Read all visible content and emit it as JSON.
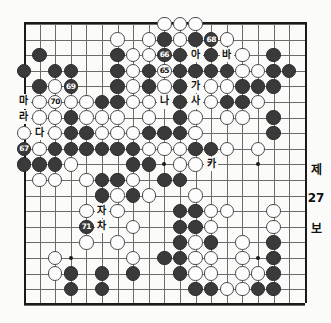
{
  "board": {
    "size": 19,
    "origin_x": 24,
    "origin_y": 22,
    "spacing": 15.6,
    "stone_radius": 7.2,
    "star_points": [
      [
        3,
        3
      ],
      [
        9,
        3
      ],
      [
        15,
        3
      ],
      [
        3,
        9
      ],
      [
        9,
        9
      ],
      [
        15,
        9
      ],
      [
        3,
        15
      ],
      [
        9,
        15
      ],
      [
        15,
        15
      ]
    ],
    "colors": {
      "black_stone": "#3a3a3a",
      "white_stone": "#fdfdfd",
      "grid": "#6b6b6b",
      "border": "#1a1a1a",
      "paper": "#fbfbf9"
    }
  },
  "stones": [
    {
      "c": "w",
      "x": 9,
      "y": 0
    },
    {
      "c": "w",
      "x": 10,
      "y": 0
    },
    {
      "c": "w",
      "x": 11,
      "y": 0
    },
    {
      "c": "w",
      "x": 6,
      "y": 1
    },
    {
      "c": "w",
      "x": 8,
      "y": 1
    },
    {
      "c": "b",
      "x": 9,
      "y": 1
    },
    {
      "c": "w",
      "x": 10,
      "y": 1
    },
    {
      "c": "b",
      "x": 11,
      "y": 1
    },
    {
      "c": "b",
      "x": 12,
      "y": 1,
      "n": "68"
    },
    {
      "c": "w",
      "x": 13,
      "y": 1
    },
    {
      "c": "b",
      "x": 1,
      "y": 2
    },
    {
      "c": "b",
      "x": 6,
      "y": 2
    },
    {
      "c": "w",
      "x": 7,
      "y": 2
    },
    {
      "c": "w",
      "x": 8,
      "y": 2
    },
    {
      "c": "b",
      "x": 9,
      "y": 2,
      "n": "66"
    },
    {
      "c": "b",
      "x": 10,
      "y": 2
    },
    {
      "c": "b",
      "x": 12,
      "y": 2
    },
    {
      "c": "w",
      "x": 14,
      "y": 2
    },
    {
      "c": "b",
      "x": 16,
      "y": 2
    },
    {
      "c": "b",
      "x": 0,
      "y": 3
    },
    {
      "c": "b",
      "x": 2,
      "y": 3
    },
    {
      "c": "b",
      "x": 3,
      "y": 3
    },
    {
      "c": "b",
      "x": 6,
      "y": 3
    },
    {
      "c": "w",
      "x": 7,
      "y": 3
    },
    {
      "c": "b",
      "x": 8,
      "y": 3
    },
    {
      "c": "w",
      "x": 9,
      "y": 3,
      "n": "65"
    },
    {
      "c": "b",
      "x": 10,
      "y": 3
    },
    {
      "c": "b",
      "x": 11,
      "y": 3
    },
    {
      "c": "b",
      "x": 12,
      "y": 3
    },
    {
      "c": "b",
      "x": 13,
      "y": 3
    },
    {
      "c": "w",
      "x": 14,
      "y": 3
    },
    {
      "c": "w",
      "x": 15,
      "y": 3
    },
    {
      "c": "b",
      "x": 16,
      "y": 3
    },
    {
      "c": "b",
      "x": 17,
      "y": 3
    },
    {
      "c": "b",
      "x": 1,
      "y": 4
    },
    {
      "c": "w",
      "x": 2,
      "y": 4
    },
    {
      "c": "b",
      "x": 3,
      "y": 4,
      "n": "69"
    },
    {
      "c": "b",
      "x": 6,
      "y": 4
    },
    {
      "c": "w",
      "x": 7,
      "y": 4
    },
    {
      "c": "b",
      "x": 8,
      "y": 4
    },
    {
      "c": "w",
      "x": 9,
      "y": 4
    },
    {
      "c": "b",
      "x": 10,
      "y": 4
    },
    {
      "c": "w",
      "x": 12,
      "y": 4
    },
    {
      "c": "w",
      "x": 13,
      "y": 4
    },
    {
      "c": "b",
      "x": 14,
      "y": 4
    },
    {
      "c": "b",
      "x": 15,
      "y": 4
    },
    {
      "c": "b",
      "x": 16,
      "y": 4
    },
    {
      "c": "w",
      "x": 1,
      "y": 5
    },
    {
      "c": "w",
      "x": 2,
      "y": 5,
      "n": "70"
    },
    {
      "c": "w",
      "x": 3,
      "y": 5
    },
    {
      "c": "w",
      "x": 4,
      "y": 5
    },
    {
      "c": "b",
      "x": 5,
      "y": 5
    },
    {
      "c": "b",
      "x": 6,
      "y": 5
    },
    {
      "c": "w",
      "x": 7,
      "y": 5
    },
    {
      "c": "w",
      "x": 8,
      "y": 5
    },
    {
      "c": "b",
      "x": 10,
      "y": 5
    },
    {
      "c": "w",
      "x": 12,
      "y": 5
    },
    {
      "c": "b",
      "x": 13,
      "y": 5
    },
    {
      "c": "b",
      "x": 14,
      "y": 5
    },
    {
      "c": "w",
      "x": 15,
      "y": 5
    },
    {
      "c": "w",
      "x": 1,
      "y": 6
    },
    {
      "c": "w",
      "x": 2,
      "y": 6
    },
    {
      "c": "b",
      "x": 3,
      "y": 6
    },
    {
      "c": "w",
      "x": 4,
      "y": 6
    },
    {
      "c": "w",
      "x": 5,
      "y": 6
    },
    {
      "c": "w",
      "x": 6,
      "y": 6
    },
    {
      "c": "w",
      "x": 8,
      "y": 6
    },
    {
      "c": "b",
      "x": 10,
      "y": 6
    },
    {
      "c": "w",
      "x": 11,
      "y": 6
    },
    {
      "c": "w",
      "x": 13,
      "y": 6
    },
    {
      "c": "w",
      "x": 14,
      "y": 6
    },
    {
      "c": "b",
      "x": 16,
      "y": 6
    },
    {
      "c": "w",
      "x": 0,
      "y": 7
    },
    {
      "c": "w",
      "x": 2,
      "y": 7
    },
    {
      "c": "b",
      "x": 3,
      "y": 7
    },
    {
      "c": "b",
      "x": 4,
      "y": 7
    },
    {
      "c": "w",
      "x": 5,
      "y": 7
    },
    {
      "c": "w",
      "x": 6,
      "y": 7
    },
    {
      "c": "w",
      "x": 7,
      "y": 7
    },
    {
      "c": "b",
      "x": 8,
      "y": 7
    },
    {
      "c": "b",
      "x": 9,
      "y": 7
    },
    {
      "c": "b",
      "x": 10,
      "y": 7
    },
    {
      "c": "w",
      "x": 11,
      "y": 7
    },
    {
      "c": "b",
      "x": 16,
      "y": 7
    },
    {
      "c": "b",
      "x": 0,
      "y": 8,
      "n": "67"
    },
    {
      "c": "w",
      "x": 1,
      "y": 8
    },
    {
      "c": "b",
      "x": 2,
      "y": 8
    },
    {
      "c": "b",
      "x": 3,
      "y": 8
    },
    {
      "c": "b",
      "x": 4,
      "y": 8
    },
    {
      "c": "b",
      "x": 5,
      "y": 8
    },
    {
      "c": "b",
      "x": 6,
      "y": 8
    },
    {
      "c": "b",
      "x": 7,
      "y": 8
    },
    {
      "c": "w",
      "x": 8,
      "y": 8
    },
    {
      "c": "w",
      "x": 9,
      "y": 8
    },
    {
      "c": "w",
      "x": 10,
      "y": 8
    },
    {
      "c": "b",
      "x": 11,
      "y": 8
    },
    {
      "c": "b",
      "x": 12,
      "y": 8
    },
    {
      "c": "w",
      "x": 13,
      "y": 8
    },
    {
      "c": "w",
      "x": 15,
      "y": 8
    },
    {
      "c": "b",
      "x": 0,
      "y": 9
    },
    {
      "c": "b",
      "x": 1,
      "y": 9
    },
    {
      "c": "b",
      "x": 2,
      "y": 9
    },
    {
      "c": "w",
      "x": 3,
      "y": 9
    },
    {
      "c": "b",
      "x": 7,
      "y": 9
    },
    {
      "c": "b",
      "x": 8,
      "y": 9
    },
    {
      "c": "w",
      "x": 10,
      "y": 9
    },
    {
      "c": "w",
      "x": 11,
      "y": 9
    },
    {
      "c": "w",
      "x": 1,
      "y": 10
    },
    {
      "c": "w",
      "x": 2,
      "y": 10
    },
    {
      "c": "w",
      "x": 4,
      "y": 10
    },
    {
      "c": "b",
      "x": 5,
      "y": 10
    },
    {
      "c": "b",
      "x": 6,
      "y": 10
    },
    {
      "c": "w",
      "x": 7,
      "y": 10
    },
    {
      "c": "b",
      "x": 9,
      "y": 10
    },
    {
      "c": "b",
      "x": 10,
      "y": 10
    },
    {
      "c": "b",
      "x": 5,
      "y": 11
    },
    {
      "c": "w",
      "x": 6,
      "y": 11
    },
    {
      "c": "b",
      "x": 7,
      "y": 11
    },
    {
      "c": "w",
      "x": 8,
      "y": 11
    },
    {
      "c": "w",
      "x": 11,
      "y": 11
    },
    {
      "c": "w",
      "x": 4,
      "y": 12
    },
    {
      "c": "w",
      "x": 6,
      "y": 12
    },
    {
      "c": "b",
      "x": 10,
      "y": 12
    },
    {
      "c": "b",
      "x": 11,
      "y": 12
    },
    {
      "c": "w",
      "x": 12,
      "y": 12
    },
    {
      "c": "w",
      "x": 13,
      "y": 12
    },
    {
      "c": "w",
      "x": 16,
      "y": 12
    },
    {
      "c": "b",
      "x": 4,
      "y": 13,
      "n": "71"
    },
    {
      "c": "w",
      "x": 7,
      "y": 13
    },
    {
      "c": "b",
      "x": 10,
      "y": 13
    },
    {
      "c": "b",
      "x": 11,
      "y": 13
    },
    {
      "c": "w",
      "x": 12,
      "y": 13
    },
    {
      "c": "w",
      "x": 16,
      "y": 13
    },
    {
      "c": "w",
      "x": 4,
      "y": 14
    },
    {
      "c": "w",
      "x": 6,
      "y": 14
    },
    {
      "c": "b",
      "x": 10,
      "y": 14
    },
    {
      "c": "w",
      "x": 11,
      "y": 14
    },
    {
      "c": "b",
      "x": 12,
      "y": 14
    },
    {
      "c": "w",
      "x": 14,
      "y": 14
    },
    {
      "c": "b",
      "x": 16,
      "y": 14
    },
    {
      "c": "w",
      "x": 2,
      "y": 15
    },
    {
      "c": "w",
      "x": 7,
      "y": 15
    },
    {
      "c": "b",
      "x": 9,
      "y": 15
    },
    {
      "c": "b",
      "x": 10,
      "y": 15
    },
    {
      "c": "w",
      "x": 11,
      "y": 15
    },
    {
      "c": "w",
      "x": 12,
      "y": 15
    },
    {
      "c": "w",
      "x": 14,
      "y": 15
    },
    {
      "c": "b",
      "x": 16,
      "y": 15
    },
    {
      "c": "w",
      "x": 2,
      "y": 16
    },
    {
      "c": "b",
      "x": 3,
      "y": 16
    },
    {
      "c": "b",
      "x": 5,
      "y": 16
    },
    {
      "c": "b",
      "x": 7,
      "y": 16
    },
    {
      "c": "b",
      "x": 10,
      "y": 16
    },
    {
      "c": "w",
      "x": 11,
      "y": 16
    },
    {
      "c": "w",
      "x": 12,
      "y": 16
    },
    {
      "c": "w",
      "x": 14,
      "y": 16
    },
    {
      "c": "w",
      "x": 15,
      "y": 16
    },
    {
      "c": "b",
      "x": 16,
      "y": 16
    },
    {
      "c": "b",
      "x": 3,
      "y": 17
    },
    {
      "c": "b",
      "x": 5,
      "y": 17
    },
    {
      "c": "b",
      "x": 11,
      "y": 17
    },
    {
      "c": "b",
      "x": 12,
      "y": 17
    },
    {
      "c": "w",
      "x": 13,
      "y": 17
    },
    {
      "c": "w",
      "x": 14,
      "y": 17
    },
    {
      "c": "b",
      "x": 15,
      "y": 17
    },
    {
      "c": "b",
      "x": 16,
      "y": 17
    }
  ],
  "markers": [
    {
      "t": "아",
      "x": 11,
      "y": 2
    },
    {
      "t": "바",
      "x": 13,
      "y": 2
    },
    {
      "t": "가",
      "x": 11,
      "y": 4
    },
    {
      "t": "마",
      "x": 0,
      "y": 5
    },
    {
      "t": "나",
      "x": 9,
      "y": 5
    },
    {
      "t": "사",
      "x": 11,
      "y": 5
    },
    {
      "t": "라",
      "x": 0,
      "y": 6
    },
    {
      "t": "다",
      "x": 1,
      "y": 7
    },
    {
      "t": "카",
      "x": 12,
      "y": 9
    },
    {
      "t": "자",
      "x": 5,
      "y": 12
    },
    {
      "t": "차",
      "x": 5,
      "y": 13
    }
  ],
  "side_caption": {
    "line1": "제",
    "line2": "27",
    "line3": "보"
  }
}
